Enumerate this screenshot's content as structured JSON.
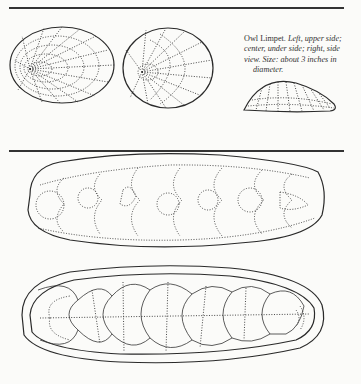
{
  "page": {
    "figure_caption": {
      "title": "Owl Limpet.",
      "line1_italic": "Left, upper side;",
      "line2": "center, under side; right, side",
      "line3": "view. Size: about 3 inches in",
      "line4": "diameter."
    },
    "figures": [
      {
        "name": "owl-limpet-upper-side",
        "description": "Owl Limpet, upper side"
      },
      {
        "name": "owl-limpet-under-side",
        "description": "Owl Limpet, under side"
      },
      {
        "name": "owl-limpet-side-view",
        "description": "Owl Limpet, side view"
      },
      {
        "name": "chiton-upper-view",
        "description": "Chiton, upper view"
      },
      {
        "name": "chiton-under-view",
        "description": "Chiton, under view"
      }
    ]
  }
}
